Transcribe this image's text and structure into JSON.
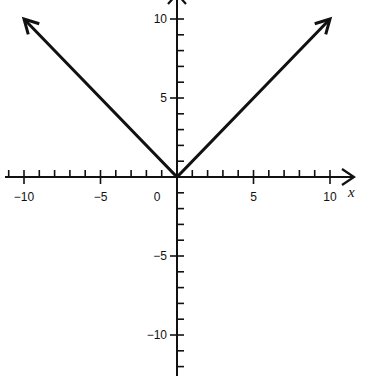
{
  "chart_data": {
    "type": "line",
    "title": "",
    "function": "y = |x|",
    "xlabel": "x",
    "ylabel": "y",
    "xlim": [
      -11,
      11
    ],
    "ylim": [
      -11,
      11
    ],
    "grid": false,
    "x_ticks": [
      -10,
      -5,
      0,
      5,
      10
    ],
    "y_ticks": [
      -10,
      -5,
      5,
      10
    ],
    "x_tick_labels": [
      "−10",
      "−5",
      "0",
      "5",
      "10"
    ],
    "y_tick_labels": [
      "10",
      "5",
      "−5",
      "−10"
    ],
    "minor_tick_step": 1,
    "series": [
      {
        "name": "y = |x|",
        "x": [
          -10,
          0,
          10
        ],
        "y": [
          10,
          0,
          10
        ],
        "arrows_at_ends": true
      }
    ],
    "color": "#111111"
  }
}
